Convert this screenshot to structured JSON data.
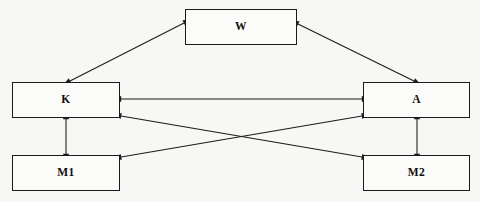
{
  "diagram": {
    "background_color": "#f7f7f5",
    "stroke_color": "#1b1b1b",
    "nodes": [
      {
        "id": "W",
        "label": "W",
        "x": 185,
        "y": 9,
        "w": 112,
        "h": 36
      },
      {
        "id": "K",
        "label": "K",
        "x": 12,
        "y": 82,
        "w": 108,
        "h": 36
      },
      {
        "id": "A",
        "label": "A",
        "x": 363,
        "y": 82,
        "w": 107,
        "h": 36
      },
      {
        "id": "M1",
        "label": "M1",
        "x": 12,
        "y": 155,
        "w": 108,
        "h": 36
      },
      {
        "id": "M2",
        "label": "M2",
        "x": 363,
        "y": 155,
        "w": 107,
        "h": 36
      }
    ],
    "edges": [
      {
        "id": "K-W",
        "from": "K",
        "to": "W",
        "kind": "double-arrow",
        "x1": 70,
        "y1": 81,
        "x2": 184,
        "y2": 23
      },
      {
        "id": "W-A",
        "from": "W",
        "to": "A",
        "kind": "double-arrow",
        "x1": 298,
        "y1": 24,
        "x2": 414,
        "y2": 81
      },
      {
        "id": "K-A",
        "from": "K",
        "to": "A",
        "kind": "double-arrow",
        "x1": 121,
        "y1": 99,
        "x2": 362,
        "y2": 99
      },
      {
        "id": "K-M2",
        "from": "K",
        "to": "M2",
        "kind": "double-arrow",
        "x1": 121,
        "y1": 116,
        "x2": 362,
        "y2": 157
      },
      {
        "id": "M1-A",
        "from": "M1",
        "to": "A",
        "kind": "double-arrow",
        "x1": 121,
        "y1": 157,
        "x2": 362,
        "y2": 116
      },
      {
        "id": "K-M1",
        "from": "K",
        "to": "M1",
        "kind": "double-arrow",
        "x1": 66,
        "y1": 119,
        "x2": 66,
        "y2": 154
      },
      {
        "id": "A-M2",
        "from": "A",
        "to": "M2",
        "kind": "double-arrow",
        "x1": 417,
        "y1": 119,
        "x2": 417,
        "y2": 154
      }
    ]
  }
}
